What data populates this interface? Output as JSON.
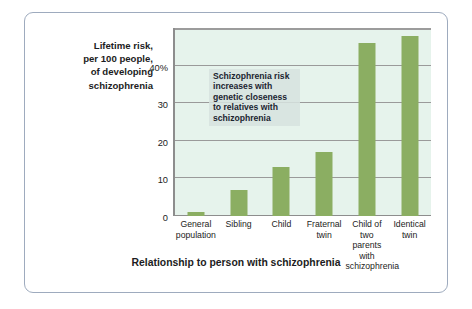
{
  "figure": {
    "y_axis_caption": "Lifetime risk,\nper 100 people,\nof developing\nschizophrenia",
    "annotation": "Schizophrenia risk increases with genetic closeness to relatives with schizophrenia",
    "x_axis_title": "Relationship to person with schizophrenia",
    "frame_color": "#9eabbe",
    "plot_background": "#e6f3ec",
    "bar_color": "#8bae62",
    "gridline_color": "#9a9a9a",
    "annotation_background": "#d6e2de"
  },
  "chart_data": {
    "type": "bar",
    "title": "",
    "subtitle": "",
    "xlabel": "Relationship to person with schizophrenia",
    "ylabel": "Lifetime risk, per 100 people, of developing schizophrenia",
    "categories": [
      "General population",
      "Sibling",
      "Child",
      "Fraternal twin",
      "Child of two parents with schizophrenia",
      "Identical twin"
    ],
    "values": [
      1,
      7,
      13,
      17,
      46,
      48
    ],
    "ylim": [
      0,
      50
    ],
    "yticks": [
      0,
      10,
      20,
      30,
      40
    ],
    "ytick_labels": [
      "0",
      "10",
      "20",
      "30",
      "40%"
    ],
    "grid": true,
    "legend": false,
    "annotations": [
      "Schizophrenia risk increases with genetic closeness to relatives with schizophrenia"
    ]
  }
}
